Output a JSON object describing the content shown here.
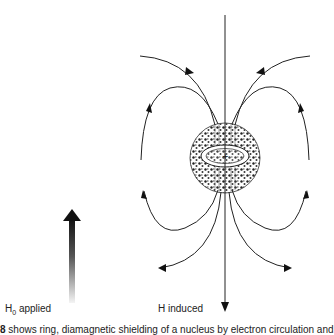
{
  "figure": {
    "labels": {
      "applied_prefix": "H",
      "applied_sub": "0",
      "applied_suffix": " applied",
      "induced": "H induced"
    },
    "caption": {
      "number": "8",
      "text": "  shows ring, diamagnetic shielding of a nucleus by electron circulation and"
    },
    "elements": {
      "applied_field_arrow": "gradient arrow pointing up",
      "nucleus_symbol": "+",
      "sphere": "electron cloud sphere with textured shading",
      "ring": "circulating electron ring"
    },
    "colors": {
      "line": "#222222",
      "arrow_dark": "#111111",
      "arrow_light": "#f2f2f2",
      "background": "#ffffff"
    }
  }
}
